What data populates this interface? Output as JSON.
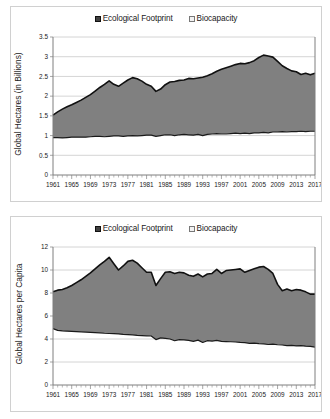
{
  "legend": {
    "footprint_label": "Ecological Footprint",
    "biocapacity_label": "Biocapacity",
    "footprint_color": "#404040",
    "biocapacity_color": "#f2f2f2"
  },
  "colors": {
    "area_fill": "#808080",
    "line": "#111111",
    "grid": "#c9c9c9",
    "axis": "#7f7f7f",
    "panel_border": "#d0d0d0"
  },
  "chart_data": [
    {
      "id": "top",
      "type": "area",
      "title": "",
      "xlabel": "",
      "ylabel": "Global Hectares (in Billions)",
      "ylim": [
        0,
        3.5
      ],
      "yticks": [
        0,
        0.5,
        1,
        1.5,
        2,
        2.5,
        3,
        3.5
      ],
      "ytick_labels": [
        "0",
        "0.5",
        "1",
        "1.5",
        "2",
        "2.5",
        "3",
        "3.5"
      ],
      "xlim": [
        1961,
        2017
      ],
      "xticks": [
        1961,
        1965,
        1969,
        1973,
        1977,
        1981,
        1985,
        1989,
        1993,
        1997,
        2001,
        2005,
        2009,
        2013,
        2017
      ],
      "xtick_labels": [
        "1961",
        "1965",
        "1969",
        "1973",
        "1977",
        "1981",
        "1985",
        "1989",
        "1993",
        "1997",
        "2001",
        "2005",
        "2009",
        "2013",
        "2017"
      ],
      "grid": true,
      "legend_position": "top",
      "x": [
        1961,
        1962,
        1963,
        1964,
        1965,
        1966,
        1967,
        1968,
        1969,
        1970,
        1971,
        1972,
        1973,
        1974,
        1975,
        1976,
        1977,
        1978,
        1979,
        1980,
        1981,
        1982,
        1983,
        1984,
        1985,
        1986,
        1987,
        1988,
        1989,
        1990,
        1991,
        1992,
        1993,
        1994,
        1995,
        1996,
        1997,
        1998,
        1999,
        2000,
        2001,
        2002,
        2003,
        2004,
        2005,
        2006,
        2007,
        2008,
        2009,
        2010,
        2011,
        2012,
        2013,
        2014,
        2015,
        2016,
        2017
      ],
      "series": [
        {
          "name": "Ecological Footprint",
          "values": [
            1.52,
            1.6,
            1.67,
            1.73,
            1.78,
            1.84,
            1.9,
            1.97,
            2.04,
            2.13,
            2.22,
            2.3,
            2.39,
            2.3,
            2.25,
            2.33,
            2.41,
            2.47,
            2.44,
            2.38,
            2.3,
            2.25,
            2.12,
            2.18,
            2.29,
            2.36,
            2.37,
            2.4,
            2.41,
            2.45,
            2.44,
            2.46,
            2.48,
            2.52,
            2.57,
            2.63,
            2.68,
            2.72,
            2.76,
            2.8,
            2.83,
            2.82,
            2.85,
            2.9,
            2.98,
            3.04,
            3.02,
            2.99,
            2.88,
            2.77,
            2.7,
            2.64,
            2.62,
            2.55,
            2.58,
            2.54,
            2.58
          ]
        },
        {
          "name": "Biocapacity",
          "values": [
            0.95,
            0.95,
            0.94,
            0.95,
            0.96,
            0.96,
            0.96,
            0.96,
            0.97,
            0.98,
            0.98,
            0.97,
            0.98,
            0.99,
            0.99,
            0.98,
            0.99,
            1.0,
            0.99,
            1.0,
            1.01,
            1.01,
            0.98,
            1.0,
            1.02,
            1.02,
            1.0,
            1.02,
            1.03,
            1.02,
            1.01,
            1.03,
            1.0,
            1.03,
            1.04,
            1.05,
            1.04,
            1.04,
            1.05,
            1.06,
            1.05,
            1.06,
            1.05,
            1.07,
            1.07,
            1.08,
            1.07,
            1.09,
            1.09,
            1.1,
            1.09,
            1.1,
            1.1,
            1.11,
            1.1,
            1.11,
            1.11
          ]
        }
      ]
    },
    {
      "id": "bottom",
      "type": "area",
      "title": "",
      "xlabel": "",
      "ylabel": "Global Hectares per Capita",
      "ylim": [
        0,
        12
      ],
      "yticks": [
        0,
        2,
        4,
        6,
        8,
        10,
        12
      ],
      "ytick_labels": [
        "0",
        "2",
        "4",
        "6",
        "8",
        "10",
        "12"
      ],
      "xlim": [
        1961,
        2017
      ],
      "xticks": [
        1961,
        1965,
        1969,
        1973,
        1977,
        1981,
        1985,
        1989,
        1993,
        1997,
        2001,
        2005,
        2009,
        2013,
        2017
      ],
      "xtick_labels": [
        "1961",
        "1965",
        "1969",
        "1973",
        "1977",
        "1981",
        "1985",
        "1989",
        "1993",
        "1997",
        "2001",
        "2005",
        "2009",
        "2013",
        "2017"
      ],
      "grid": true,
      "legend_position": "top",
      "x": [
        1961,
        1962,
        1963,
        1964,
        1965,
        1966,
        1967,
        1968,
        1969,
        1970,
        1971,
        1972,
        1973,
        1974,
        1975,
        1976,
        1977,
        1978,
        1979,
        1980,
        1981,
        1982,
        1983,
        1984,
        1985,
        1986,
        1987,
        1988,
        1989,
        1990,
        1991,
        1992,
        1993,
        1994,
        1995,
        1996,
        1997,
        1998,
        1999,
        2000,
        2001,
        2002,
        2003,
        2004,
        2005,
        2006,
        2007,
        2008,
        2009,
        2010,
        2011,
        2012,
        2013,
        2014,
        2015,
        2016,
        2017
      ],
      "series": [
        {
          "name": "Ecological Footprint",
          "values": [
            8.1,
            8.25,
            8.3,
            8.45,
            8.65,
            8.9,
            9.15,
            9.45,
            9.75,
            10.1,
            10.45,
            10.75,
            11.1,
            10.55,
            10.0,
            10.35,
            10.75,
            10.85,
            10.6,
            10.2,
            9.8,
            9.8,
            8.65,
            9.25,
            9.8,
            9.85,
            9.7,
            9.8,
            9.75,
            9.55,
            9.45,
            9.65,
            9.4,
            9.65,
            9.7,
            10.05,
            9.7,
            9.95,
            10.0,
            10.05,
            10.1,
            9.8,
            9.95,
            10.1,
            10.25,
            10.3,
            10.05,
            9.7,
            8.75,
            8.2,
            8.35,
            8.2,
            8.3,
            8.25,
            8.1,
            7.9,
            7.9
          ]
        },
        {
          "name": "Biocapacity",
          "values": [
            4.9,
            4.75,
            4.7,
            4.68,
            4.66,
            4.64,
            4.62,
            4.6,
            4.58,
            4.56,
            4.54,
            4.5,
            4.48,
            4.46,
            4.44,
            4.4,
            4.38,
            4.36,
            4.32,
            4.3,
            4.28,
            4.26,
            3.95,
            4.1,
            4.05,
            4.0,
            3.85,
            3.95,
            3.92,
            3.88,
            3.8,
            3.9,
            3.7,
            3.85,
            3.82,
            3.88,
            3.8,
            3.78,
            3.76,
            3.74,
            3.7,
            3.68,
            3.62,
            3.65,
            3.6,
            3.58,
            3.52,
            3.55,
            3.5,
            3.48,
            3.42,
            3.45,
            3.4,
            3.42,
            3.38,
            3.35,
            3.3
          ]
        }
      ]
    }
  ]
}
